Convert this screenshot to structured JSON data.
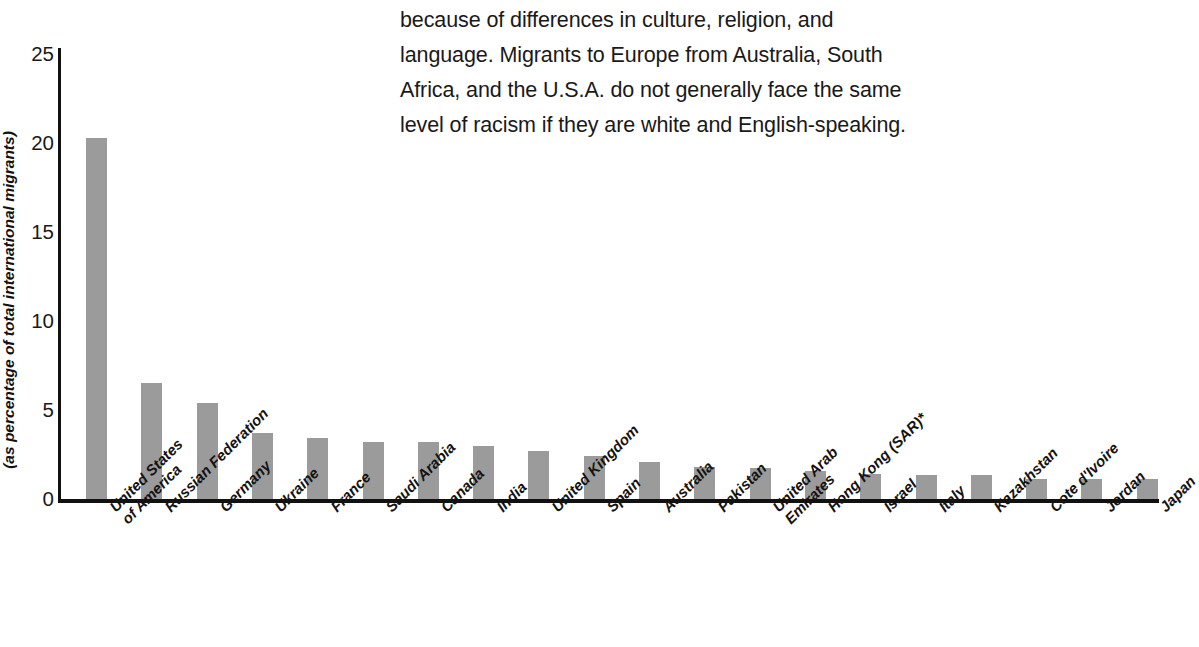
{
  "bodytext": {
    "lines": [
      "because of differences in culture, religion, and",
      "language. Migrants to Europe from Australia, South",
      "Africa, and the U.S.A. do not generally face the same",
      "level of racism if they are white and English-speaking."
    ],
    "clipped_top_line": "people in many European countries experience racism"
  },
  "chart_data": {
    "type": "bar",
    "title": "",
    "xlabel": "",
    "ylabel": "(as percentage of total international migrants)",
    "ylim": [
      0,
      25
    ],
    "yticks": [
      0,
      5,
      10,
      15,
      20,
      25
    ],
    "grid": false,
    "legend": "none",
    "bar_color": "#9b9b9b",
    "categories": [
      "United States of America",
      "Russian Federation",
      "Germany",
      "Ukraine",
      "France",
      "Saudi Arabia",
      "Canada",
      "India",
      "United Kingdom",
      "Spain",
      "Australia",
      "Pakistan",
      "United Arab Emirates",
      "Hong Kong (SAR)*",
      "Israel",
      "Italy",
      "Kazakhstan",
      "Cote d'Ivoire",
      "Jordan",
      "Japan"
    ],
    "category_lines": [
      [
        "United States",
        "of America"
      ],
      [
        "Russian Federation"
      ],
      [
        "Germany"
      ],
      [
        "Ukraine"
      ],
      [
        "France"
      ],
      [
        "Saudi Arabia"
      ],
      [
        "Canada"
      ],
      [
        "India"
      ],
      [
        "United Kingdom"
      ],
      [
        "Spain"
      ],
      [
        "Australia"
      ],
      [
        "Pakistan"
      ],
      [
        "United Arab",
        "Emirates"
      ],
      [
        "Hong Kong (SAR)*"
      ],
      [
        "Israel"
      ],
      [
        "Italy"
      ],
      [
        "Kazakhstan"
      ],
      [
        "Cote d'Ivoire"
      ],
      [
        "Jordan"
      ],
      [
        "Japan"
      ]
    ],
    "values": [
      20.3,
      6.5,
      5.4,
      3.7,
      3.4,
      3.2,
      3.2,
      3.0,
      2.7,
      2.4,
      2.1,
      1.8,
      1.75,
      1.6,
      1.4,
      1.35,
      1.35,
      1.15,
      1.1,
      1.1
    ]
  }
}
